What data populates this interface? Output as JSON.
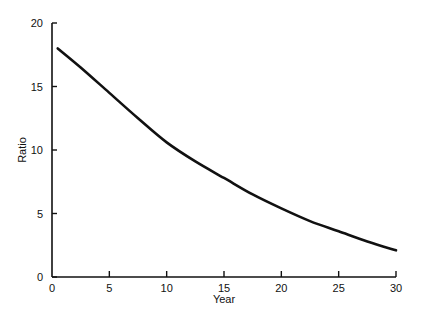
{
  "chart_data": {
    "type": "line",
    "title": "",
    "xlabel": "Year",
    "ylabel": "Ratio",
    "xlim": [
      0,
      30
    ],
    "ylim": [
      0,
      20
    ],
    "xticks": [
      0,
      5,
      10,
      15,
      20,
      25,
      30
    ],
    "yticks": [
      0,
      5,
      10,
      15,
      20
    ],
    "grid": false,
    "legend": null,
    "series": [
      {
        "name": "Ratio",
        "color": "#111111",
        "x": [
          0.5,
          2.5,
          5,
          7.5,
          10,
          12.5,
          15,
          17.5,
          20,
          22.5,
          25,
          27.5,
          30
        ],
        "y": [
          18.0,
          16.5,
          14.5,
          12.5,
          10.6,
          9.1,
          7.8,
          6.5,
          5.4,
          4.4,
          3.6,
          2.8,
          2.1
        ]
      }
    ]
  }
}
